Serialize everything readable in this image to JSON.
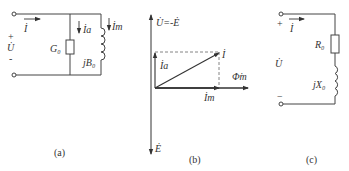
{
  "figures": [
    {
      "id": "a",
      "caption": "(a)",
      "title": "Parallel equivalent circuit",
      "labels": {
        "current": "İ",
        "voltage": "U̇",
        "plus": "+",
        "minus": "-",
        "conductance": "G₀",
        "susceptance": "jB₀",
        "current_a": "İa",
        "current_m": "İm"
      }
    },
    {
      "id": "b",
      "caption": "(b)",
      "title": "Phasor diagram",
      "labels": {
        "voltage_axis": "U̇=-Ė",
        "emf": "Ė",
        "flux": "Φ̇m",
        "current": "İ",
        "current_a": "İa",
        "current_m": "İm"
      }
    },
    {
      "id": "c",
      "caption": "(c)",
      "title": "Series equivalent circuit",
      "labels": {
        "current": "İ",
        "voltage": "U̇",
        "plus": "+",
        "minus": "−",
        "resistance": "R₀",
        "reactance": "jX₀"
      }
    }
  ]
}
